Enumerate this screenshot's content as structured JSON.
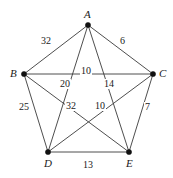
{
  "figure": {
    "width": 173,
    "height": 178,
    "background_color": "#ffffff",
    "edge_color": "#3a3a3a",
    "vertex_color": "#111111",
    "label_color": "#1a1a1a"
  },
  "chart_data": {
    "type": "diagram",
    "graph_type": "weighted undirected complete graph K5",
    "title": "",
    "nodes": [
      {
        "id": "A",
        "label": "A",
        "x": 88,
        "y": 25,
        "label_dx": -4,
        "label_dy": -16
      },
      {
        "id": "B",
        "label": "B",
        "x": 24,
        "y": 74,
        "label_dx": -14,
        "label_dy": -6
      },
      {
        "id": "C",
        "label": "C",
        "x": 153,
        "y": 74,
        "label_dx": 6,
        "label_dy": -6
      },
      {
        "id": "D",
        "label": "D",
        "x": 48,
        "y": 152,
        "label_dx": -4,
        "label_dy": 6
      },
      {
        "id": "E",
        "label": "E",
        "x": 129,
        "y": 152,
        "label_dx": -3,
        "label_dy": 6
      }
    ],
    "edges": [
      {
        "from": "A",
        "to": "B",
        "weight": 32,
        "label": "32",
        "lx": 40,
        "ly": 36
      },
      {
        "from": "A",
        "to": "C",
        "weight": 6,
        "label": "6",
        "lx": 119,
        "ly": 36
      },
      {
        "from": "B",
        "to": "C",
        "weight": 10,
        "label": "10",
        "lx": 80,
        "ly": 66
      },
      {
        "from": "A",
        "to": "D",
        "weight": 20,
        "label": "20",
        "lx": 59,
        "ly": 79
      },
      {
        "from": "A",
        "to": "E",
        "weight": 14,
        "label": "14",
        "lx": 103,
        "ly": 79
      },
      {
        "from": "B",
        "to": "D",
        "weight": 25,
        "label": "25",
        "lx": 18,
        "ly": 102
      },
      {
        "from": "C",
        "to": "E",
        "weight": 7,
        "label": "7",
        "lx": 144,
        "ly": 102
      },
      {
        "from": "B",
        "to": "E",
        "weight": 32,
        "label": "32",
        "lx": 65,
        "ly": 101
      },
      {
        "from": "C",
        "to": "D",
        "weight": 10,
        "label": "10",
        "lx": 94,
        "ly": 101
      },
      {
        "from": "D",
        "to": "E",
        "weight": 13,
        "label": "13",
        "lx": 82,
        "ly": 160
      }
    ],
    "legend": [],
    "annotations": []
  }
}
